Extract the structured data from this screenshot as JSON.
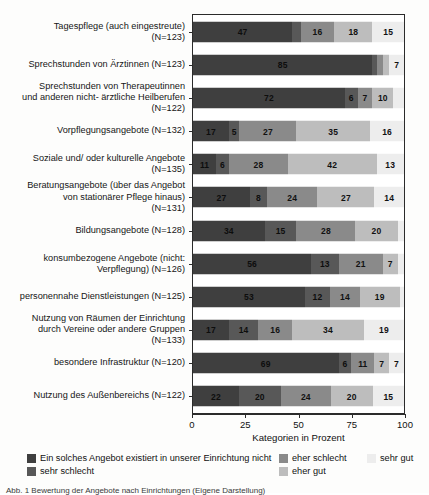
{
  "chart_data": {
    "type": "bar",
    "orientation": "horizontal",
    "stacked": true,
    "stack_mode": "percent",
    "title": "",
    "xlabel": "Kategorien in Prozent",
    "ylabel": "",
    "xlim": [
      0,
      100
    ],
    "xticks": [
      0,
      25,
      50,
      75,
      100
    ],
    "xticklabels": [
      "0",
      "25",
      "50",
      "75",
      "100"
    ],
    "grid": false,
    "legend_position": "bottom",
    "categories": [
      "Tagespflege (auch eingestreute)\n(N=123)",
      "Sprechstunden von Ärztinnen (N=123)",
      "Sprechstunden von Therapeutinnen\nund anderen nicht- ärztliche Heilberufen\n(N=122)",
      "Vorpflegungsangebote (N=132)",
      "Soziale und/ oder kulturelle Angebote\n(N=135)",
      "Beratungsangebote (über das Angebot\nvon stationärer Pflege hinaus)\n(N=131)",
      "Bildungsangebote (N=128)",
      "konsumbezogene Angebote (nicht:\nVerpflegung) (N=126)",
      "personennahe Dienstleistungen (N=125)",
      "Nutzung von Räumen der Einrichtung\ndurch Vereine oder andere Gruppen\n(N=133)",
      "besondere Infrastruktur (N=120)",
      "Nutzung des Außenbereichs (N=122)"
    ],
    "series": [
      {
        "name": "Ein solches Angebot existiert in unserer Einrichtung nicht",
        "color": "#3f3f3f",
        "values": [
          47,
          85,
          72,
          17,
          11,
          27,
          34,
          56,
          53,
          17,
          69,
          22
        ]
      },
      {
        "name": "sehr schlecht",
        "color": "#585858",
        "values": [
          4,
          2,
          6,
          5,
          6,
          8,
          15,
          13,
          12,
          14,
          6,
          20
        ]
      },
      {
        "name": "eher schlecht",
        "color": "#8a8a8a",
        "values": [
          16,
          3,
          7,
          27,
          28,
          24,
          28,
          21,
          14,
          16,
          11,
          24
        ]
      },
      {
        "name": "eher gut",
        "color": "#bdbdbd",
        "values": [
          18,
          3,
          10,
          35,
          42,
          27,
          20,
          7,
          19,
          34,
          7,
          20
        ]
      },
      {
        "name": "sehr gut",
        "color": "#ededed",
        "values": [
          15,
          7,
          5,
          16,
          13,
          14,
          3,
          3,
          2,
          19,
          7,
          15
        ]
      }
    ],
    "bar_labels": [
      [
        "47",
        "",
        "16",
        "18",
        "15"
      ],
      [
        "85",
        "",
        "",
        "",
        "7"
      ],
      [
        "72",
        "6",
        "7",
        "10",
        ""
      ],
      [
        "17",
        "5",
        "27",
        "35",
        "16"
      ],
      [
        "11",
        "6",
        "28",
        "42",
        "13"
      ],
      [
        "27",
        "8",
        "24",
        "27",
        "14"
      ],
      [
        "34",
        "15",
        "28",
        "20",
        ""
      ],
      [
        "56",
        "13",
        "21",
        "7",
        ""
      ],
      [
        "53",
        "12",
        "14",
        "19",
        ""
      ],
      [
        "17",
        "14",
        "16",
        "34",
        "19"
      ],
      [
        "69",
        "6",
        "11",
        "7",
        "7"
      ],
      [
        "22",
        "20",
        "24",
        "20",
        "15"
      ]
    ]
  },
  "legend": {
    "items": [
      {
        "label": "Ein solches Angebot existiert in unserer Einrichtung nicht",
        "color": "#3f3f3f",
        "row": 0,
        "col": 0
      },
      {
        "label": "eher schlecht",
        "color": "#8a8a8a",
        "row": 0,
        "col": 1
      },
      {
        "label": "sehr gut",
        "color": "#ededed",
        "row": 0,
        "col": 2
      },
      {
        "label": "sehr schlecht",
        "color": "#585858",
        "row": 1,
        "col": 0
      },
      {
        "label": "eher gut",
        "color": "#bdbdbd",
        "row": 1,
        "col": 1
      }
    ]
  },
  "caption": {
    "text": "Abb. 1 Bewertung der Angebote nach Einrichtungen (Eigene Darstellung)"
  }
}
